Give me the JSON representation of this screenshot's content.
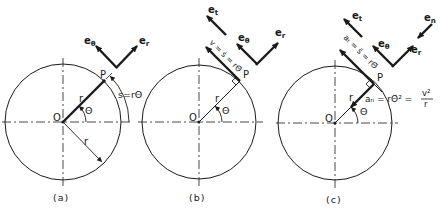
{
  "figure": {
    "colors": {
      "ink": "#1a1a1a",
      "background": "#ffffff"
    }
  },
  "panels": [
    {
      "id": "a",
      "caption": "(a)",
      "origin_label": "O",
      "point_label": "P",
      "radius_label": "r",
      "radius_label_2": "r",
      "angle_label": "Θ",
      "arc_label": "s=rΘ",
      "unit_vectors": {
        "e_theta": "e",
        "e_theta_sub": "θ",
        "e_r": "e",
        "e_r_sub": "r"
      }
    },
    {
      "id": "b",
      "caption": "(b)",
      "origin_label": "O",
      "point_label": "P",
      "radius_label": "r",
      "angle_label": "Θ",
      "velocity_label": "v = ṡ = rΘ̇",
      "unit_vectors": {
        "e_t": "e",
        "e_t_sub": "t",
        "e_theta": "e",
        "e_theta_sub": "θ",
        "e_r": "e",
        "e_r_sub": "r"
      }
    },
    {
      "id": "c",
      "caption": "(c)",
      "origin_label": "O",
      "point_label": "P",
      "radius_label": "r",
      "angle_label": "Θ",
      "tangential_accel_label": "aₜ = s̈ = rΘ̈",
      "normal_accel_label": "aₙ = rΘ̇² =",
      "normal_accel_fraction_num": "v²",
      "normal_accel_fraction_den": "r",
      "unit_vectors": {
        "e_t": "e",
        "e_t_sub": "t",
        "e_n": "e",
        "e_n_sub": "n",
        "e_theta": "e",
        "e_theta_sub": "θ",
        "e_r": "e",
        "e_r_sub": "r"
      }
    }
  ]
}
